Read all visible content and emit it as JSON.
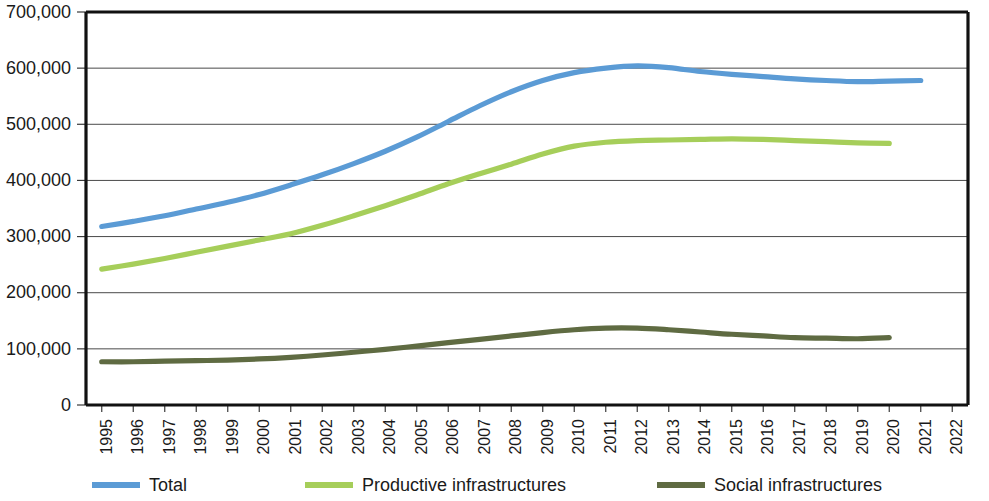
{
  "chart_data": {
    "type": "line",
    "title": "",
    "subtitle": "",
    "xlabel": "",
    "ylabel": "",
    "grid": true,
    "legend_position": "bottom",
    "xlim": [
      1995,
      2022
    ],
    "ylim": [
      0,
      700000
    ],
    "y_ticks": [
      "0",
      "100,000",
      "200,000",
      "300,000",
      "400,000",
      "500,000",
      "600,000",
      "700,000"
    ],
    "y_tick_values": [
      0,
      100000,
      200000,
      300000,
      400000,
      500000,
      600000,
      700000
    ],
    "categories": [
      "1995",
      "1996",
      "1997",
      "1998",
      "1999",
      "2000",
      "2001",
      "2002",
      "2003",
      "2004",
      "2005",
      "2006",
      "2007",
      "2008",
      "2009",
      "2010",
      "2011",
      "2012",
      "2013",
      "2014",
      "2015",
      "2016",
      "2017",
      "2018",
      "2019",
      "2020",
      "2021",
      "2022"
    ],
    "series": [
      {
        "name": "Total",
        "color": "#5B9BD5",
        "x": [
          1995,
          1996,
          1997,
          1998,
          1999,
          2000,
          2001,
          2002,
          2003,
          2004,
          2005,
          2006,
          2007,
          2008,
          2009,
          2010,
          2011,
          2012,
          2013,
          2014,
          2015,
          2016,
          2017,
          2018,
          2019,
          2020,
          2021
        ],
        "values": [
          318000,
          327000,
          337000,
          349000,
          361000,
          375000,
          392000,
          410000,
          430000,
          452000,
          477000,
          505000,
          533000,
          558000,
          578000,
          592000,
          600000,
          604000,
          601000,
          594000,
          589000,
          585000,
          581000,
          578000,
          576000,
          577000,
          578000
        ]
      },
      {
        "name": "Productive infrastructures",
        "color": "#A6CE5A",
        "x": [
          1995,
          1996,
          1997,
          1998,
          1999,
          2000,
          2001,
          2002,
          2003,
          2004,
          2005,
          2006,
          2007,
          2008,
          2009,
          2010,
          2011,
          2012,
          2013,
          2014,
          2015,
          2016,
          2017,
          2018,
          2019,
          2020
        ],
        "values": [
          242000,
          251000,
          261000,
          272000,
          283000,
          294000,
          305000,
          320000,
          337000,
          355000,
          374000,
          394000,
          412000,
          429000,
          447000,
          461000,
          468000,
          471000,
          472000,
          473000,
          474000,
          473000,
          471000,
          469000,
          467000,
          466000
        ]
      },
      {
        "name": "Social infrastructures",
        "color": "#5F6B42",
        "x": [
          1995,
          1996,
          1997,
          1998,
          1999,
          2000,
          2001,
          2002,
          2003,
          2004,
          2005,
          2006,
          2007,
          2008,
          2009,
          2010,
          2011,
          2012,
          2013,
          2014,
          2015,
          2016,
          2017,
          2018,
          2019,
          2020
        ],
        "values": [
          77000,
          77000,
          78000,
          79000,
          80000,
          82000,
          85000,
          89000,
          94000,
          99000,
          105000,
          111000,
          117000,
          123000,
          129000,
          134000,
          137000,
          137000,
          134000,
          130000,
          126000,
          123000,
          120000,
          119000,
          118000,
          120000
        ]
      }
    ]
  },
  "legend": {
    "items": [
      {
        "label": "Total",
        "color": "#5B9BD5"
      },
      {
        "label": "Productive infrastructures",
        "color": "#A6CE5A"
      },
      {
        "label": "Social infrastructures",
        "color": "#5F6B42"
      }
    ]
  }
}
